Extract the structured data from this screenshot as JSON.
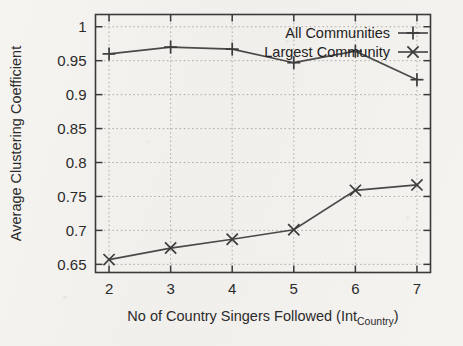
{
  "figure": {
    "kind": "scientific-line-plot",
    "background_color": "#f4f2ef",
    "ink_color": "#3c3c3c",
    "grid_color": "#a9a6a1"
  },
  "chart_data": {
    "type": "line",
    "title": "",
    "xlabel": "No of Country Singers Followed (Int",
    "xlabel_subscript": "Country",
    "xlabel_suffix": ")",
    "ylabel": "Average Clustering Coefficient",
    "x": [
      2,
      3,
      4,
      5,
      6,
      7
    ],
    "xtick_labels": [
      "2",
      "3",
      "4",
      "5",
      "6",
      "7"
    ],
    "ytick_labels": [
      "0.65",
      "0.7",
      "0.75",
      "0.8",
      "0.85",
      "0.9",
      "0.95",
      "1"
    ],
    "ytick_values": [
      0.65,
      0.7,
      0.75,
      0.8,
      0.85,
      0.9,
      0.95,
      1
    ],
    "xlim": [
      1.78,
      7.22
    ],
    "ylim": [
      0.638,
      1.018
    ],
    "grid": true,
    "legend_position": "top-right-inside",
    "series": [
      {
        "name": "All Communities",
        "marker": "plus",
        "values": [
          0.96,
          0.97,
          0.967,
          0.947,
          0.964,
          0.922
        ]
      },
      {
        "name": "Largest Community",
        "marker": "cross",
        "values": [
          0.657,
          0.674,
          0.687,
          0.701,
          0.759,
          0.767
        ]
      }
    ]
  }
}
